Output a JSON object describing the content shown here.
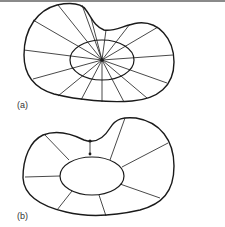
{
  "figure": {
    "panels": [
      {
        "label": "(a)",
        "description": "Closed bean-shaped region with inner ellipse; radial lines from a single central point to the outer boundary",
        "ray_count": 16,
        "center_point": true
      },
      {
        "label": "(b)",
        "description": "Same bean-shaped region with an inner ellipse hole; radial segments connect inner ellipse to outer boundary, one segment marked with two dots",
        "segment_count": 9,
        "marked_segment_dots": 2
      }
    ]
  },
  "colors": {
    "stroke": "#1a1a1a",
    "rule": "#8a8a8a",
    "background": "#ffffff"
  }
}
